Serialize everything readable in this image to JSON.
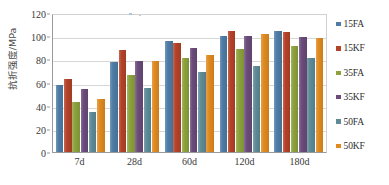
{
  "chart_data": {
    "type": "bar",
    "title": "",
    "xlabel": "",
    "ylabel": "抗折强度/MPa",
    "ylim": [
      0,
      120
    ],
    "ytick_step": 20,
    "yticks": [
      0,
      20,
      40,
      60,
      80,
      100,
      120
    ],
    "grid": true,
    "legend_position": "right",
    "categories": [
      "7d",
      "28d",
      "60d",
      "120d",
      "180d"
    ],
    "series": [
      {
        "name": "15FA",
        "color": "#4e7ca6",
        "values": [
          58,
          78,
          95.5,
          100,
          104.5
        ]
      },
      {
        "name": "15KF",
        "color": "#b44228",
        "values": [
          63,
          88.5,
          94.5,
          104.5,
          103.5
        ]
      },
      {
        "name": "35FA",
        "color": "#8ca23c",
        "values": [
          43.5,
          66.5,
          81,
          89,
          91.5
        ]
      },
      {
        "name": "35KF",
        "color": "#6a4b7b",
        "values": [
          54.5,
          79,
          89.5,
          100,
          99
        ]
      },
      {
        "name": "50FA",
        "color": "#5d8b97",
        "values": [
          34.5,
          55,
          69,
          74.5,
          81
        ]
      },
      {
        "name": "50KF",
        "color": "#e08a1f",
        "values": [
          46,
          79,
          83.5,
          101.5,
          98
        ]
      }
    ]
  },
  "axis": {
    "y_title": "抗折强度/MPa"
  }
}
